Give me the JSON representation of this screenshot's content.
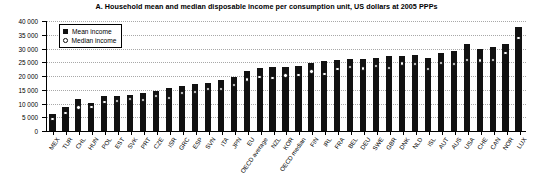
{
  "chart_data": {
    "type": "bar",
    "title": "A. Household mean and median disposable income per consumption unit, US dollars at 2005 PPPs",
    "xlabel": "",
    "ylabel": "",
    "ylim": [
      0,
      40000
    ],
    "yticks": [
      0,
      5000,
      10000,
      15000,
      20000,
      25000,
      30000,
      35000,
      40000
    ],
    "ytick_labels": [
      "0",
      "5 000",
      "10 000",
      "15 000",
      "20 000",
      "25 000",
      "30 000",
      "35 000",
      "40 000"
    ],
    "grid": true,
    "legend_position": "top-left",
    "legend": [
      {
        "key": "mean",
        "label": "Mean income",
        "marker": "filled-square",
        "color": "#111111"
      },
      {
        "key": "median",
        "label": "Median income",
        "marker": "open-circle",
        "color": "#111111"
      }
    ],
    "categories": [
      "MEX",
      "TUR",
      "CHL",
      "HUN",
      "POL",
      "EST",
      "SVK",
      "PRT",
      "CZE",
      "ISR",
      "GRC",
      "ESP",
      "SVN",
      "ITA",
      "JPN",
      "EU",
      "OECD average",
      "NZL",
      "KOR",
      "OECD median",
      "FIN",
      "IRL",
      "FRA",
      "BEL",
      "DEU",
      "SWE",
      "GBR",
      "DNK",
      "NLD",
      "ISL",
      "AUT",
      "AUS",
      "USA",
      "CHE",
      "CAN",
      "NOR",
      "LUX"
    ],
    "series": [
      {
        "name": "Mean income",
        "values": [
          6200,
          8800,
          11600,
          10300,
          12600,
          12900,
          13100,
          13800,
          14500,
          15600,
          16200,
          17000,
          17400,
          18600,
          19600,
          21700,
          23000,
          23200,
          23400,
          23600,
          24900,
          25600,
          25900,
          26200,
          26300,
          26600,
          27200,
          27400,
          27500,
          26400,
          28200,
          29200,
          31600,
          29900,
          30600,
          31600,
          37800
        ]
      },
      {
        "name": "Median income",
        "values": [
          4300,
          6500,
          8600,
          8800,
          10500,
          11000,
          11600,
          11200,
          12700,
          12000,
          13800,
          14200,
          15300,
          15200,
          16700,
          18700,
          19700,
          19200,
          20200,
          20400,
          21700,
          20800,
          22600,
          23200,
          22800,
          23700,
          22900,
          24500,
          24300,
          22500,
          24800,
          24300,
          25800,
          25700,
          25900,
          28300,
          33900
        ]
      }
    ]
  }
}
